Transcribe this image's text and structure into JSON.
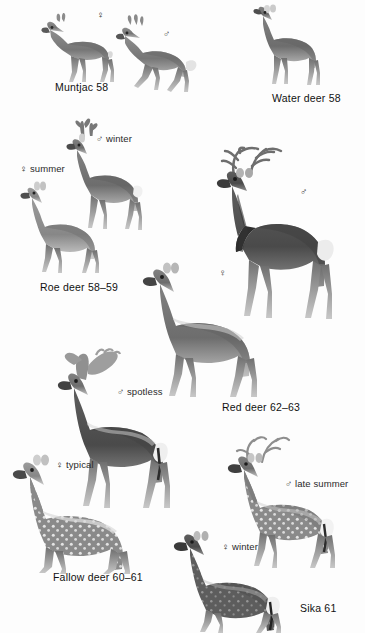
{
  "plate": {
    "title": "British deer identification plate",
    "background_color": "#fdfdfd",
    "text_color": "#1a1a1a",
    "symbols": {
      "female": "♀",
      "male": "♂"
    }
  },
  "groups": [
    {
      "id": "muntjac",
      "caption": "Muntjac  58",
      "caption_pos": {
        "x": 55,
        "y": 82
      },
      "figures": [
        {
          "id": "muntjac-female",
          "label": "♀",
          "label_pos": {
            "x": 70,
            "y": 12
          },
          "pose": "standing",
          "antlers": "none",
          "coat": "plain-dark",
          "box": {
            "x": 38,
            "y": 10,
            "w": 80,
            "h": 70
          }
        },
        {
          "id": "muntjac-male",
          "label": "♂",
          "label_pos": {
            "x": 163,
            "y": 30
          },
          "pose": "walking",
          "antlers": "short-spike",
          "coat": "plain-dark",
          "box": {
            "x": 115,
            "y": 16,
            "w": 90,
            "h": 80
          }
        }
      ]
    },
    {
      "id": "water-deer",
      "caption": "Water deer  58",
      "caption_pos": {
        "x": 272,
        "y": 93
      },
      "figures": [
        {
          "id": "water-deer-figure",
          "label": "",
          "label_pos": null,
          "pose": "standing",
          "antlers": "none",
          "coat": "plain-dark",
          "box": {
            "x": 243,
            "y": 6,
            "w": 82,
            "h": 80
          }
        }
      ]
    },
    {
      "id": "roe-deer",
      "caption": "Roe deer  58–59",
      "caption_pos": {
        "x": 40,
        "y": 282
      },
      "figures": [
        {
          "id": "roe-male-winter",
          "label": "♂ winter",
          "label_pos": {
            "x": 96,
            "y": 138
          },
          "pose": "standing",
          "antlers": "roe-antlers",
          "coat": "plain-grey",
          "box": {
            "x": 60,
            "y": 118,
            "w": 85,
            "h": 115
          }
        },
        {
          "id": "roe-female-summer",
          "label": "♀ summer",
          "label_pos": {
            "x": 20,
            "y": 168
          },
          "pose": "standing",
          "antlers": "none",
          "coat": "plain-tan",
          "box": {
            "x": 12,
            "y": 178,
            "w": 95,
            "h": 95
          }
        }
      ]
    },
    {
      "id": "red-deer",
      "caption": "Red deer  62–63",
      "caption_pos": {
        "x": 222,
        "y": 402
      },
      "figures": [
        {
          "id": "red-deer-stag",
          "label": "♂",
          "label_pos": {
            "x": 300,
            "y": 190
          },
          "pose": "standing",
          "antlers": "large-branched",
          "coat": "dark-mane",
          "box": {
            "x": 196,
            "y": 150,
            "w": 155,
            "h": 215
          }
        },
        {
          "id": "red-deer-hind",
          "label": "♀",
          "label_pos": {
            "x": 220,
            "y": 270
          },
          "pose": "standing",
          "antlers": "none",
          "coat": "plain-brown",
          "box": {
            "x": 140,
            "y": 248,
            "w": 145,
            "h": 150
          }
        }
      ]
    },
    {
      "id": "fallow-deer",
      "caption": "Fallow deer  60–61",
      "caption_pos": {
        "x": 53,
        "y": 572
      },
      "figures": [
        {
          "id": "fallow-male-spotless",
          "label": "♂ spotless",
          "label_pos": {
            "x": 117,
            "y": 390
          },
          "pose": "standing",
          "antlers": "palmate",
          "coat": "dark-spotless",
          "box": {
            "x": 48,
            "y": 350,
            "w": 130,
            "h": 160
          }
        },
        {
          "id": "fallow-female-typical",
          "label": "♀ typical",
          "label_pos": {
            "x": 56,
            "y": 463
          },
          "pose": "standing",
          "antlers": "none",
          "coat": "spotted",
          "box": {
            "x": 8,
            "y": 445,
            "w": 140,
            "h": 125
          }
        }
      ]
    },
    {
      "id": "sika",
      "caption": "Sika  61",
      "caption_pos": {
        "x": 300,
        "y": 603
      },
      "figures": [
        {
          "id": "sika-male-late-summer",
          "label": "♂ late summer",
          "label_pos": {
            "x": 285,
            "y": 482
          },
          "pose": "standing",
          "antlers": "sika-antlers",
          "coat": "spotted",
          "box": {
            "x": 218,
            "y": 438,
            "w": 130,
            "h": 130
          }
        },
        {
          "id": "sika-female-winter",
          "label": "♀ winter",
          "label_pos": {
            "x": 222,
            "y": 545
          },
          "pose": "standing",
          "antlers": "none",
          "coat": "dark-spotted",
          "box": {
            "x": 168,
            "y": 520,
            "w": 125,
            "h": 110
          }
        }
      ]
    }
  ]
}
